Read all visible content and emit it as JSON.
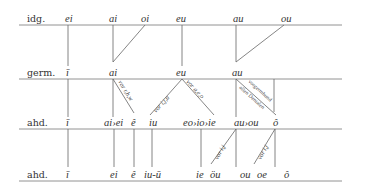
{
  "rows": {
    "r1": {
      "label": "idg."
    },
    "r2": {
      "label": "germ."
    },
    "r3": {
      "label": "ahd."
    },
    "r4": {
      "label": "ahd."
    }
  },
  "idg": {
    "ei": "ei",
    "ai": "ai",
    "oi": "oi",
    "eu": "eu",
    "au": "au",
    "ou": "ou"
  },
  "germ": {
    "i": "ī",
    "ai": "ai",
    "eu": "eu",
    "au": "au"
  },
  "ahd1": {
    "i": "ī",
    "aiei": "ai›ei",
    "e": "ê",
    "iu": "iu",
    "eoioie": "eo›io›ie",
    "auou": "au›ou",
    "o": "ô"
  },
  "ahd2": {
    "i": "ī",
    "ei": "ei",
    "e": "ê",
    "iuu": "iu-ū",
    "ie": "ie",
    "ou_uml": "öu",
    "ou": "ou",
    "oe": "oe",
    "o": "ô"
  },
  "conditions": {
    "vor_rhw": "vor r,h,w",
    "vor_iju": "vor i,j,u",
    "vor_aeo": "vor a,e,o",
    "vorgermhund": "vorgermhund",
    "allen_dentalen": "allen Dentalen",
    "vor_ij_1": "vor i,j",
    "vor_ij_2": "vor i,j"
  }
}
